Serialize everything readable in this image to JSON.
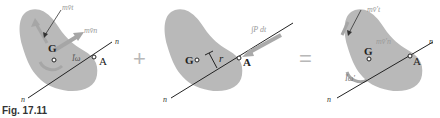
{
  "figure": {
    "caption": "Fig. 17.11",
    "colors": {
      "body_fill": "#b9b9b9",
      "vector_gray": "#aaaaaa",
      "line": "#222222"
    },
    "operators": {
      "plus": "+",
      "equals": "="
    },
    "panels": [
      {
        "id": "initial-momenta",
        "labels": {
          "linear_momentum_t": "mv̄t",
          "linear_momentum_n": "mv̄n",
          "angular_momentum": "Īω",
          "center": "G",
          "point": "A",
          "axis_top": "n",
          "axis_bottom": "n"
        }
      },
      {
        "id": "impulse",
        "labels": {
          "impulse": "∫P dt",
          "distance": "r",
          "center": "G",
          "point": "A",
          "axis_bottom": "n"
        }
      },
      {
        "id": "final-momenta",
        "labels": {
          "linear_momentum_t": "mv̄'t",
          "linear_momentum_n": "mv̄'n",
          "angular_momentum": "Īω'",
          "center": "G",
          "point": "A",
          "axis_top": "n",
          "axis_bottom": "n"
        }
      }
    ]
  }
}
